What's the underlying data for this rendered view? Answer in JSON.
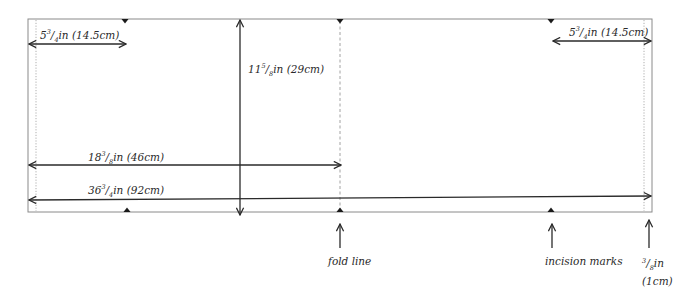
{
  "diagram": {
    "colors": {
      "outline": "#8a8a8a",
      "arrow": "#2a2a2a",
      "seam": "#9a9a9a",
      "notch": "#1a1a1a",
      "text": "#2a2a2a"
    },
    "measurements": {
      "top_left_width": {
        "whole": "5",
        "num": "3",
        "den": "4",
        "unit": "in",
        "metric": "(14.5cm)"
      },
      "top_right_width": {
        "whole": "5",
        "num": "3",
        "den": "4",
        "unit": "in",
        "metric": "(14.5cm)"
      },
      "height": {
        "whole": "11",
        "num": "5",
        "den": "8",
        "unit": "in",
        "metric": "(29cm)"
      },
      "half_length": {
        "whole": "18",
        "num": "3",
        "den": "8",
        "unit": "in",
        "metric": "(46cm)"
      },
      "full_length": {
        "whole": "36",
        "num": "3",
        "den": "4",
        "unit": "in",
        "metric": "(92cm)"
      }
    },
    "callouts": {
      "fold_line": "fold line",
      "incision_marks": "incision marks",
      "seam_allowance": {
        "whole": "",
        "num": "3",
        "den": "8",
        "unit": "in",
        "metric": "(1cm)"
      }
    }
  }
}
